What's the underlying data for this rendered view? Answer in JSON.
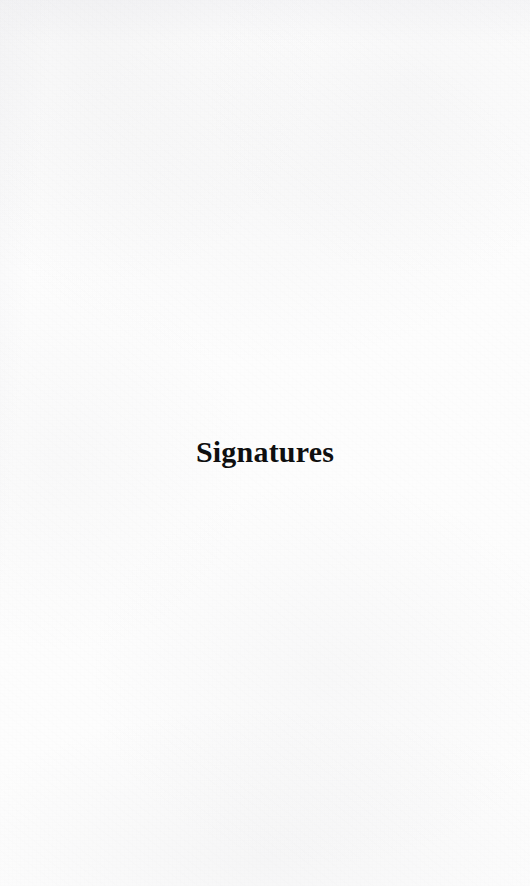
{
  "document": {
    "type": "scanned-book-page",
    "page_kind": "section-divider",
    "width_px": 530,
    "height_px": 886,
    "paper_color": "#fdfdfd",
    "ink_color": "#0f0f0f"
  },
  "section": {
    "title": "Signatures"
  }
}
